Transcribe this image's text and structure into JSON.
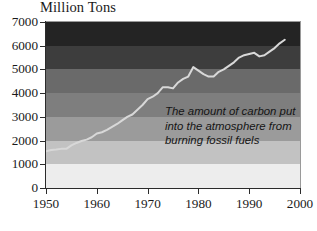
{
  "chart_data": {
    "type": "line",
    "title": "Million Tons",
    "subtitle": "",
    "xlabel": "",
    "ylabel": "Million Tons",
    "xlim": [
      1950,
      2000
    ],
    "ylim": [
      0,
      7000
    ],
    "grid": false,
    "legend": "none",
    "annotation": "The amount of carbon put\ninto the atmosphere from\nburning fossil fuels",
    "y_ticks": [
      0,
      1000,
      2000,
      3000,
      4000,
      5000,
      6000,
      7000
    ],
    "y_tick_labels": [
      "0",
      "1000",
      "2000",
      "3000",
      "4000",
      "5000",
      "6000",
      "7000"
    ],
    "x_ticks": [
      1950,
      1960,
      1970,
      1980,
      1990,
      2000
    ],
    "x_tick_labels": [
      "1950",
      "1960",
      "1970",
      "1980",
      "1990",
      "2000"
    ],
    "series": [
      {
        "name": "Carbon emissions from fossil fuels",
        "line_color": "#d8d8d8",
        "x": [
          1950,
          1951,
          1952,
          1953,
          1954,
          1955,
          1956,
          1957,
          1958,
          1959,
          1960,
          1961,
          1962,
          1963,
          1964,
          1965,
          1966,
          1967,
          1968,
          1969,
          1970,
          1971,
          1972,
          1973,
          1974,
          1975,
          1976,
          1977,
          1978,
          1979,
          1980,
          1981,
          1982,
          1983,
          1984,
          1985,
          1986,
          1987,
          1988,
          1989,
          1990,
          1991,
          1992,
          1993,
          1994,
          1995,
          1996,
          1997
        ],
        "values": [
          1550,
          1600,
          1620,
          1650,
          1650,
          1800,
          1900,
          1980,
          2040,
          2140,
          2300,
          2350,
          2450,
          2580,
          2700,
          2850,
          3000,
          3100,
          3300,
          3500,
          3750,
          3850,
          4000,
          4250,
          4250,
          4200,
          4450,
          4600,
          4700,
          5100,
          4950,
          4800,
          4700,
          4700,
          4900,
          5000,
          5150,
          5300,
          5500,
          5600,
          5650,
          5700,
          5550,
          5600,
          5750,
          5900,
          6100,
          6250
        ]
      }
    ],
    "background_bands": [
      {
        "from": 6000,
        "to": 7000,
        "color": "#242424"
      },
      {
        "from": 5000,
        "to": 6000,
        "color": "#3d3d3d"
      },
      {
        "from": 4000,
        "to": 5000,
        "color": "#6a6a6a"
      },
      {
        "from": 3000,
        "to": 4000,
        "color": "#7e7e7e"
      },
      {
        "from": 2000,
        "to": 3000,
        "color": "#9b9b9b"
      },
      {
        "from": 1000,
        "to": 2000,
        "color": "#c2c2c2"
      },
      {
        "from": 0,
        "to": 1000,
        "color": "#ededed"
      }
    ]
  },
  "colors": {
    "axis": "#2b2b2b",
    "text": "#1a1a1a",
    "line": "#d8d8d8",
    "page_background": "#ffffff"
  }
}
